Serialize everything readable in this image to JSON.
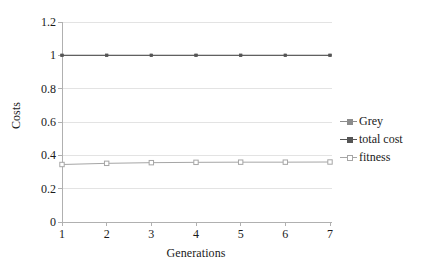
{
  "chart_data": {
    "type": "line",
    "title": "",
    "xlabel": "Generations",
    "ylabel": "Costs",
    "x": [
      1,
      2,
      3,
      4,
      5,
      6,
      7
    ],
    "xtick_labels": [
      "1",
      "2",
      "3",
      "4",
      "5",
      "6",
      "7"
    ],
    "ytick_labels": [
      "0",
      "0.2",
      "0.4",
      "0.6",
      "0.8",
      "1",
      "1.2"
    ],
    "ytick_values": [
      0,
      0.2,
      0.4,
      0.6,
      0.8,
      1,
      1.2
    ],
    "ylim": [
      0,
      1.2
    ],
    "xlim": [
      1,
      7
    ],
    "grid": "horizontal",
    "legend_position": "right",
    "series": [
      {
        "name": "Grey",
        "color": "#8c8c8c",
        "marker": "dot",
        "values": [
          1.0,
          1.0,
          1.0,
          1.0,
          1.0,
          1.0,
          1.0
        ]
      },
      {
        "name": "total cost",
        "color": "#555555",
        "marker": "dot",
        "values": [
          1.0,
          1.0,
          1.0,
          1.0,
          1.0,
          1.0,
          1.0
        ]
      },
      {
        "name": "fitness",
        "color": "#a6a6a6",
        "marker": "square",
        "values": [
          0.345,
          0.352,
          0.356,
          0.358,
          0.359,
          0.359,
          0.36
        ]
      }
    ]
  },
  "colors": {
    "grid": "#e3e3e3",
    "axis": "#b0b0b0",
    "background": "#ffffff",
    "text": "#1a1a1a"
  }
}
